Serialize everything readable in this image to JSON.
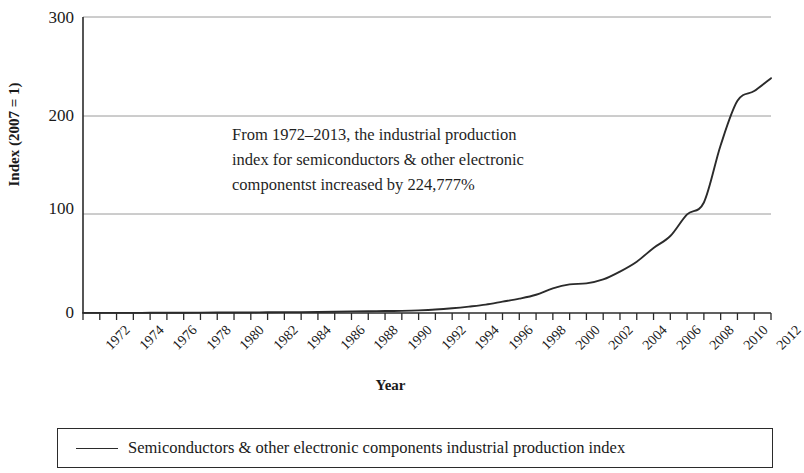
{
  "chart_data": {
    "type": "line",
    "title": "",
    "xlabel": "Year",
    "ylabel": "Index (2007 = 1)",
    "xlim": [
      1972,
      2013
    ],
    "ylim": [
      0,
      300
    ],
    "yticks": [
      0,
      100,
      200,
      300
    ],
    "grid": "horizontal",
    "legend_position": "bottom",
    "annotation": [
      "From 1972–2013, the industrial production",
      "index for semiconductors & other electronic",
      "componentst increased by 224,777%"
    ],
    "xticks": [
      "1972",
      "1974",
      "1976",
      "1978",
      "1980",
      "1982",
      "1984",
      "1986",
      "1988",
      "1990",
      "1992",
      "1994",
      "1996",
      "1998",
      "2000",
      "2002",
      "2004",
      "2006",
      "2008",
      "2010",
      "2012"
    ],
    "series": [
      {
        "name": "Semiconductors & other electronic components industrial production index",
        "color": "#2b2b2b",
        "x": [
          1972,
          1973,
          1974,
          1975,
          1976,
          1977,
          1978,
          1979,
          1980,
          1981,
          1982,
          1983,
          1984,
          1985,
          1986,
          1987,
          1988,
          1989,
          1990,
          1991,
          1992,
          1993,
          1994,
          1995,
          1996,
          1997,
          1998,
          1999,
          2000,
          2001,
          2002,
          2003,
          2004,
          2005,
          2006,
          2007,
          2008,
          2009,
          2010,
          2011,
          2012,
          2013
        ],
        "values": [
          0.1,
          0.12,
          0.15,
          0.14,
          0.2,
          0.25,
          0.32,
          0.4,
          0.45,
          0.5,
          0.55,
          0.7,
          0.9,
          0.9,
          1.0,
          1.3,
          1.6,
          1.8,
          2.0,
          2.2,
          2.7,
          3.5,
          4.8,
          6.5,
          8.5,
          11.5,
          14.5,
          18.5,
          25.0,
          29.0,
          30.0,
          34.0,
          42.0,
          52.0,
          66.0,
          78.0,
          100.0,
          112.0,
          170.0,
          215.0,
          225.0,
          238.0
        ]
      }
    ]
  },
  "axis": {
    "y_label": "Index (2007 = 1)",
    "x_label": "Year",
    "y_tick_labels": [
      "300",
      "200",
      "100",
      "0"
    ]
  },
  "legend": {
    "entry_label": "Semiconductors & other electronic components industrial production index"
  }
}
